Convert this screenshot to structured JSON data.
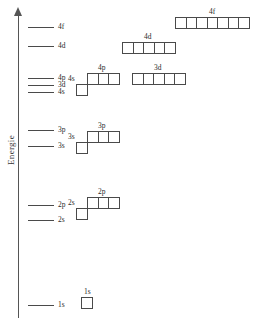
{
  "axis": {
    "label": "Energie",
    "arrow_icon": "up-arrow-icon"
  },
  "levels": [
    {
      "label": "4f",
      "x": 28,
      "width": 26,
      "y": 27,
      "label_x": 58,
      "label_y": 23
    },
    {
      "label": "4d",
      "x": 28,
      "width": 26,
      "y": 46,
      "label_x": 58,
      "label_y": 42
    },
    {
      "label": "4p",
      "x": 28,
      "width": 26,
      "y": 78,
      "label_x": 58,
      "label_y": 74
    },
    {
      "label": "3d",
      "x": 28,
      "width": 26,
      "y": 85,
      "label_x": 58,
      "label_y": 81
    },
    {
      "label": "4s",
      "x": 28,
      "width": 26,
      "y": 92,
      "label_x": 58,
      "label_y": 88
    },
    {
      "label": "3p",
      "x": 28,
      "width": 26,
      "y": 130,
      "label_x": 58,
      "label_y": 126
    },
    {
      "label": "3s",
      "x": 28,
      "width": 26,
      "y": 146,
      "label_x": 58,
      "label_y": 142
    },
    {
      "label": "2p",
      "x": 28,
      "width": 26,
      "y": 205,
      "label_x": 58,
      "label_y": 201
    },
    {
      "label": "2s",
      "x": 28,
      "width": 26,
      "y": 220,
      "label_x": 58,
      "label_y": 216
    },
    {
      "label": "1s",
      "x": 28,
      "width": 26,
      "y": 305,
      "label_x": 58,
      "label_y": 301
    }
  ],
  "orbital_groups": [
    {
      "label": "4f",
      "boxes": 7,
      "x": 175,
      "y": 17,
      "label_x": 209,
      "label_y": 8
    },
    {
      "label": "4d",
      "boxes": 5,
      "x": 122,
      "y": 42,
      "label_x": 144,
      "label_y": 33
    },
    {
      "label": "3d",
      "boxes": 5,
      "x": 132,
      "y": 73,
      "label_x": 154,
      "label_y": 64
    },
    {
      "label": "4p",
      "boxes": 3,
      "x": 87,
      "y": 73,
      "label_x": 98,
      "label_y": 64
    },
    {
      "label": "4s",
      "boxes": 1,
      "x": 76,
      "y": 84,
      "label_x": 68,
      "label_y": 75
    },
    {
      "label": "3p",
      "boxes": 3,
      "x": 87,
      "y": 131,
      "label_x": 98,
      "label_y": 122
    },
    {
      "label": "3s",
      "boxes": 1,
      "x": 76,
      "y": 142,
      "label_x": 68,
      "label_y": 133
    },
    {
      "label": "2p",
      "boxes": 3,
      "x": 87,
      "y": 197,
      "label_x": 98,
      "label_y": 188
    },
    {
      "label": "2s",
      "boxes": 1,
      "x": 76,
      "y": 208,
      "label_x": 68,
      "label_y": 199
    },
    {
      "label": "1s",
      "boxes": 1,
      "x": 81,
      "y": 297,
      "label_x": 84,
      "label_y": 288
    }
  ],
  "colors": {
    "axis": "#555555",
    "level": "#4a4a4a",
    "box_border": "#4a4a4a",
    "text": "#2b2b2b",
    "background": "#ffffff"
  }
}
